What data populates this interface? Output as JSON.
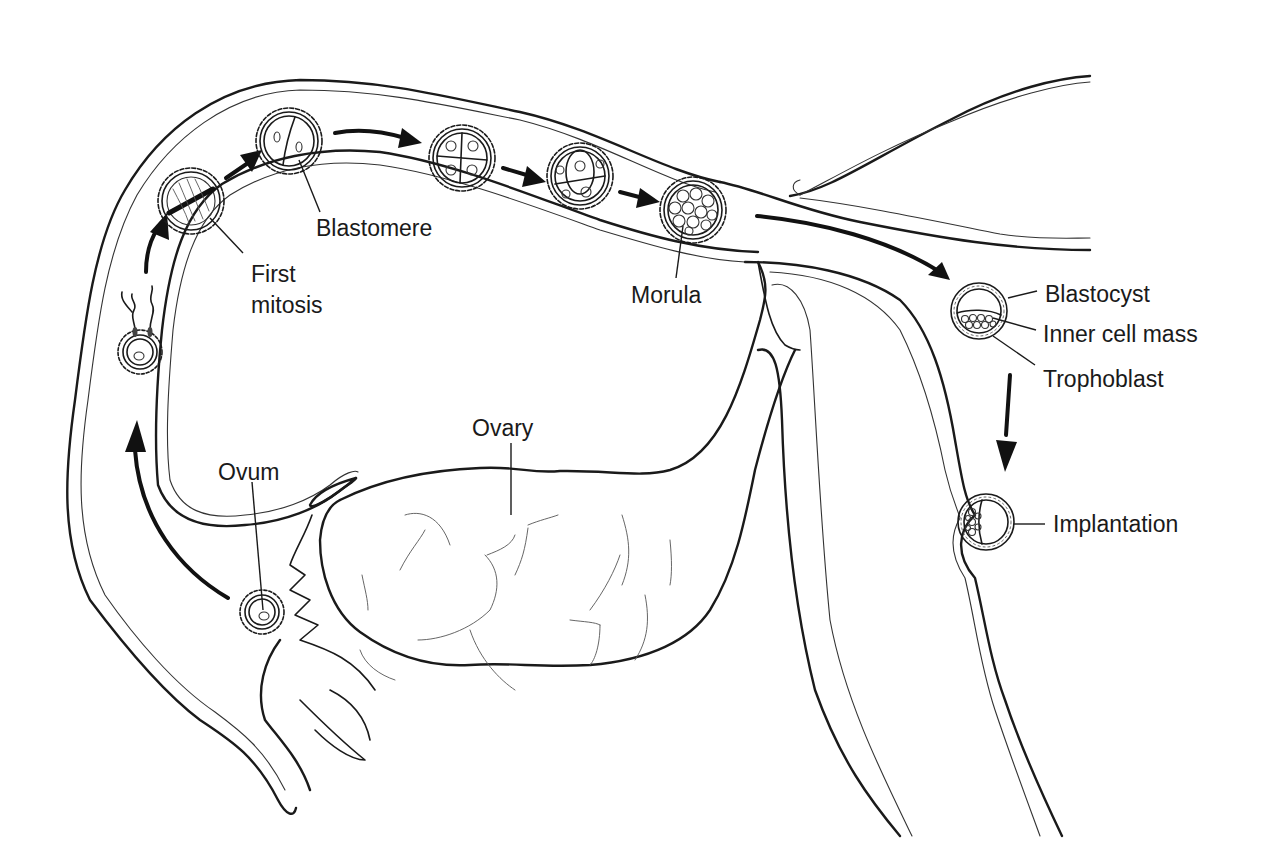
{
  "figure": {
    "colors": {
      "ink": "#1a1a1a",
      "background": "#ffffff"
    }
  },
  "labels": {
    "ovum": "Ovum",
    "first_mitosis_line1": "First",
    "first_mitosis_line2": "mitosis",
    "blastomere": "Blastomere",
    "morula": "Morula",
    "ovary": "Ovary",
    "blastocyst": "Blastocyst",
    "inner_cell_mass": "Inner cell mass",
    "trophoblast": "Trophoblast",
    "implantation": "Implantation"
  },
  "stages": [
    {
      "name": "ovum",
      "label_key": "ovum"
    },
    {
      "name": "fertilization",
      "label_key": null
    },
    {
      "name": "first-mitosis",
      "label_key": "first_mitosis"
    },
    {
      "name": "two-cell",
      "label_key": "blastomere"
    },
    {
      "name": "four-cell",
      "label_key": null
    },
    {
      "name": "eight-cell",
      "label_key": null
    },
    {
      "name": "morula",
      "label_key": "morula"
    },
    {
      "name": "blastocyst",
      "label_key": "blastocyst"
    },
    {
      "name": "implantation",
      "label_key": "implantation"
    }
  ]
}
